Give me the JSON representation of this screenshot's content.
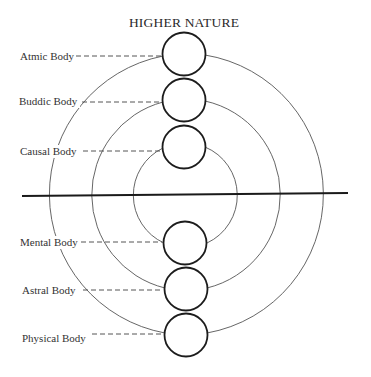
{
  "diagram": {
    "title": "HIGHER NATURE",
    "colors": {
      "background": "#ffffff",
      "ink": "#1c1c1c",
      "arc": "#555555"
    },
    "bodies": [
      {
        "label": "Atmic Body",
        "group": "higher",
        "cx": 184,
        "cy": 54,
        "label_x": 20,
        "label_y": 60,
        "leader_x1": 76,
        "leader_y": 56
      },
      {
        "label": "Buddic Body",
        "group": "higher",
        "cx": 184,
        "cy": 100,
        "label_x": 19,
        "label_y": 105,
        "leader_x1": 82,
        "leader_y": 102
      },
      {
        "label": "Causal Body",
        "group": "higher",
        "cx": 184,
        "cy": 147,
        "label_x": 20,
        "label_y": 155,
        "leader_x1": 83,
        "leader_y": 151
      },
      {
        "label": "Mental Body",
        "group": "lower",
        "cx": 185,
        "cy": 243,
        "label_x": 20,
        "label_y": 246,
        "leader_x1": 81,
        "leader_y": 242
      },
      {
        "label": "Astral Body",
        "group": "lower",
        "cx": 186,
        "cy": 289,
        "label_x": 22,
        "label_y": 294,
        "leader_x1": 83,
        "leader_y": 290
      },
      {
        "label": "Physical Body",
        "group": "lower",
        "cx": 186,
        "cy": 335,
        "label_x": 22,
        "label_y": 342,
        "leader_x1": 92,
        "leader_y": 334
      }
    ],
    "connections": [
      {
        "name": "outer-arc",
        "pair": [
          "Atmic Body",
          "Physical Body"
        ]
      },
      {
        "name": "middle-arc",
        "pair": [
          "Buddic Body",
          "Astral Body"
        ]
      },
      {
        "name": "inner-arc",
        "pair": [
          "Causal Body",
          "Mental Body"
        ]
      }
    ],
    "divider": {
      "x1": 22,
      "y1": 196,
      "x2": 348,
      "y2": 193
    }
  }
}
